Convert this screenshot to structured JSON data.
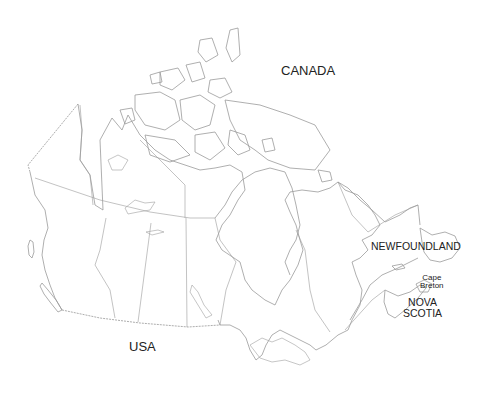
{
  "map": {
    "title": "Canada outline map",
    "labels": {
      "country": "CANADA",
      "neighbor": "USA",
      "newfoundland": "NEWFOUNDLAND",
      "cape_breton_line1": "Cape",
      "cape_breton_line2": "Breton",
      "nova_scotia_line1": "NOVA",
      "nova_scotia_line2": "SCOTIA"
    },
    "colors": {
      "background": "#ffffff",
      "outline": "#9a9a9a",
      "text": "#222222"
    }
  }
}
